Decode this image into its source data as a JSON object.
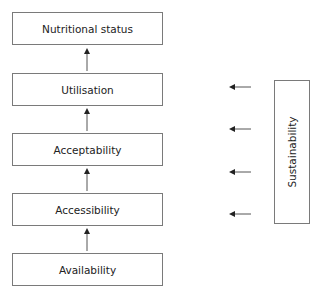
{
  "diagram": {
    "levels": [
      {
        "label": "Nutritional status"
      },
      {
        "label": "Utilisation"
      },
      {
        "label": "Acceptability"
      },
      {
        "label": "Accessibility"
      },
      {
        "label": "Availability"
      }
    ],
    "side_box": {
      "label": "Sustainability"
    },
    "colors": {
      "stroke": "#7a7a7a",
      "arrow": "#333333",
      "text": "#222222"
    }
  }
}
